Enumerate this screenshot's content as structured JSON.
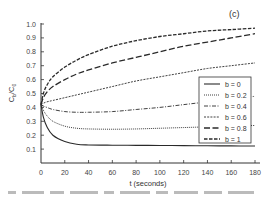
{
  "chart_data": {
    "type": "line",
    "title": "",
    "panel_label": "(c)",
    "xlabel": "t (seconds)",
    "ylabel": "C_b/C_0",
    "xlim": [
      0,
      180
    ],
    "ylim": [
      0,
      1.0
    ],
    "x_ticks": [
      0,
      20,
      40,
      60,
      80,
      100,
      120,
      140,
      160,
      180
    ],
    "y_ticks": [
      0.1,
      0.2,
      0.3,
      0.4,
      0.5,
      0.6,
      0.7,
      0.8,
      0.9,
      1.0
    ],
    "grid": false,
    "legend_position": "right-middle (inside plot)",
    "x": [
      0,
      2,
      5,
      10,
      20,
      30,
      40,
      60,
      80,
      100,
      120,
      140,
      160,
      180
    ],
    "series": [
      {
        "name": "b = 0",
        "style": "solid",
        "values": [
          0.42,
          0.33,
          0.26,
          0.2,
          0.155,
          0.135,
          0.13,
          0.128,
          0.127,
          0.126,
          0.125,
          0.124,
          0.123,
          0.122
        ]
      },
      {
        "name": "b = 0.2",
        "style": "dotted",
        "values": [
          0.42,
          0.38,
          0.34,
          0.3,
          0.265,
          0.25,
          0.245,
          0.243,
          0.245,
          0.25,
          0.255,
          0.26,
          0.265,
          0.27
        ]
      },
      {
        "name": "b = 0.4",
        "style": "dash-dot",
        "values": [
          0.42,
          0.41,
          0.4,
          0.385,
          0.37,
          0.365,
          0.365,
          0.37,
          0.385,
          0.4,
          0.42,
          0.44,
          0.46,
          0.48
        ]
      },
      {
        "name": "b = 0.6",
        "style": "short-dash",
        "values": [
          0.42,
          0.43,
          0.44,
          0.45,
          0.47,
          0.49,
          0.51,
          0.55,
          0.59,
          0.62,
          0.65,
          0.68,
          0.7,
          0.72
        ]
      },
      {
        "name": "b = 0.8",
        "style": "long-dash",
        "values": [
          0.42,
          0.47,
          0.51,
          0.55,
          0.6,
          0.64,
          0.67,
          0.72,
          0.76,
          0.8,
          0.84,
          0.87,
          0.9,
          0.93
        ]
      },
      {
        "name": "b = 1",
        "style": "dash",
        "values": [
          0.42,
          0.5,
          0.56,
          0.62,
          0.69,
          0.74,
          0.78,
          0.84,
          0.88,
          0.91,
          0.93,
          0.95,
          0.96,
          0.97
        ]
      }
    ]
  },
  "labels": {
    "panel": "(c)",
    "xlabel": "t (seconds)",
    "ylabel_main": "C",
    "ylabel_sub_b": "b",
    "ylabel_slash": "/C",
    "ylabel_sub_0": "0"
  }
}
